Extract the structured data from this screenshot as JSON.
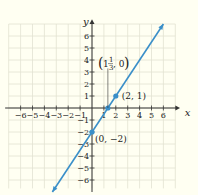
{
  "chart_data": {
    "type": "line",
    "title": "",
    "xlabel": "x",
    "ylabel": "y",
    "xlim": [
      -7,
      7
    ],
    "ylim": [
      -7,
      7
    ],
    "grid": true,
    "x_ticks": [
      -6,
      -5,
      -4,
      -3,
      -2,
      -1,
      1,
      2,
      3,
      4,
      5,
      6
    ],
    "y_ticks": [
      6,
      5,
      4,
      3,
      2,
      1,
      -1,
      -2,
      -3,
      -4,
      -5,
      -6
    ],
    "series": [
      {
        "name": "y = (3/2)x - 2",
        "x": [
          -3.33,
          6
        ],
        "y": [
          -7,
          7
        ],
        "color": "#3a8fc9"
      }
    ],
    "points": [
      {
        "x": 2,
        "y": 1,
        "label": "(2, 1)"
      },
      {
        "x": 1.333,
        "y": 0,
        "label": "(1⅓, 0)"
      },
      {
        "x": 0,
        "y": -2,
        "label": "(0, −2)"
      }
    ],
    "annotations": {
      "p1": "(2, 1)",
      "p2_whole": "1",
      "p2_num": "1",
      "p2_den": "3",
      "p2_rest": ", 0",
      "p3": "(0, −2)"
    }
  },
  "colors": {
    "line": "#3a8fc9",
    "grid": "#e2e2d2",
    "axis": "#333333",
    "background": "#fffff2"
  }
}
